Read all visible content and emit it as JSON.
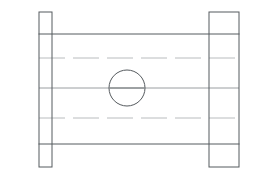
{
  "drawing": {
    "title": "Flanged Spool Section View",
    "view_type": "orthographic-front-section",
    "canvas": {
      "width": 270,
      "height": 179,
      "background": "#ffffff"
    },
    "colors": {
      "visible_edge": "#555a5e",
      "hidden_edge": "#b9bcbe",
      "center_axis": "#9a9ea1",
      "hole_edge": "#555a5e",
      "hole_axis": "#6f7477",
      "face_fill": "#ffffff"
    },
    "line_styles": {
      "visible": "solid",
      "hidden": "dashed",
      "center": "solid-thin"
    },
    "parts": {
      "left_flange": {
        "name": "left-flange",
        "x": 39,
        "y": 12,
        "width": 13,
        "height": 155
      },
      "right_flange": {
        "name": "right-flange",
        "x": 209,
        "y": 12,
        "width": 30,
        "height": 155
      },
      "body": {
        "name": "center-body",
        "x": 39,
        "y": 34,
        "width": 200,
        "height": 110
      },
      "bore_hole": {
        "name": "bore-hole",
        "center_x": 127,
        "center_y": 88,
        "radius": 18
      }
    },
    "hidden_lines": [
      {
        "name": "upper-bore-wall",
        "y": 58,
        "x_start": 39,
        "x_end": 239
      },
      {
        "name": "lower-bore-wall",
        "y": 118,
        "x_start": 39,
        "x_end": 239
      }
    ],
    "center_lines": [
      {
        "name": "horizontal-center-axis",
        "y": 88,
        "x_start": 39,
        "x_end": 239
      }
    ],
    "hole_axis": {
      "name": "hole-center-mark",
      "y": 88,
      "x_start": 110,
      "x_end": 144
    }
  }
}
